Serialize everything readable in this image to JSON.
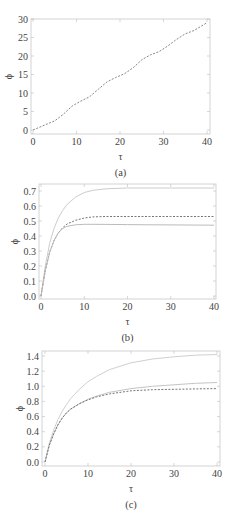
{
  "chart_data": [
    {
      "id": "a",
      "type": "line",
      "caption": "(a)",
      "xlabel": "τ",
      "ylabel": "ϕ",
      "xlim": [
        0,
        40
      ],
      "ylim": [
        0,
        30
      ],
      "xticks": [
        0,
        10,
        20,
        30,
        40
      ],
      "yticks": [
        0,
        5,
        10,
        15,
        20,
        25,
        30
      ],
      "grid": false,
      "series": [
        {
          "name": "dashed",
          "style": "dashed",
          "color": "#777777",
          "x": [
            0,
            3,
            5,
            7,
            9,
            11,
            13,
            15,
            17,
            19,
            21,
            23,
            25,
            27,
            29,
            31,
            33,
            35,
            37,
            40
          ],
          "y": [
            0,
            1.5,
            2.5,
            4.3,
            6.5,
            7.8,
            9.0,
            11.0,
            13.0,
            14.2,
            15.2,
            16.8,
            19.0,
            20.3,
            21.2,
            22.7,
            24.5,
            26.0,
            26.9,
            29.0
          ]
        }
      ]
    },
    {
      "id": "b",
      "type": "line",
      "caption": "(b)",
      "xlabel": "τ",
      "ylabel": "ϕ",
      "xlim": [
        0,
        40
      ],
      "ylim": [
        0,
        0.7
      ],
      "xticks": [
        0,
        10,
        20,
        30,
        40
      ],
      "yticks": [
        0.0,
        0.1,
        0.2,
        0.3,
        0.4,
        0.5,
        0.6,
        0.7
      ],
      "grid": false,
      "series": [
        {
          "name": "upper-solid",
          "style": "solid",
          "color": "#cccccc",
          "x": [
            0,
            1,
            2,
            3,
            4,
            5,
            6,
            8,
            10,
            12,
            15,
            20,
            25,
            30,
            40
          ],
          "y": [
            0,
            0.2,
            0.35,
            0.45,
            0.52,
            0.57,
            0.61,
            0.66,
            0.69,
            0.705,
            0.715,
            0.72,
            0.72,
            0.72,
            0.72
          ]
        },
        {
          "name": "dashed",
          "style": "dashed",
          "color": "#666666",
          "x": [
            0,
            1,
            2,
            3,
            4,
            5,
            6,
            8,
            10,
            12,
            15,
            20,
            25,
            30,
            40
          ],
          "y": [
            0,
            0.17,
            0.29,
            0.37,
            0.42,
            0.455,
            0.48,
            0.505,
            0.52,
            0.527,
            0.53,
            0.53,
            0.53,
            0.53,
            0.53
          ]
        },
        {
          "name": "lower-solid",
          "style": "solid",
          "color": "#bbbbbb",
          "x": [
            0,
            1,
            2,
            3,
            4,
            5,
            6,
            8,
            10,
            12,
            15,
            20,
            25,
            30,
            40
          ],
          "y": [
            0,
            0.17,
            0.29,
            0.37,
            0.42,
            0.45,
            0.465,
            0.475,
            0.478,
            0.478,
            0.477,
            0.476,
            0.475,
            0.474,
            0.472
          ]
        }
      ]
    },
    {
      "id": "c",
      "type": "line",
      "caption": "(c)",
      "xlabel": "τ",
      "ylabel": "ϕ",
      "xlim": [
        0,
        40
      ],
      "ylim": [
        0,
        1.4
      ],
      "xticks": [
        0,
        10,
        20,
        30,
        40
      ],
      "yticks": [
        0.0,
        0.2,
        0.4,
        0.6,
        0.8,
        1.0,
        1.2,
        1.4
      ],
      "grid": false,
      "series": [
        {
          "name": "upper-solid",
          "style": "solid",
          "color": "#d0d0d0",
          "x": [
            0,
            1,
            2,
            3,
            4,
            5,
            6,
            8,
            10,
            12,
            15,
            20,
            25,
            30,
            35,
            40
          ],
          "y": [
            0,
            0.25,
            0.42,
            0.56,
            0.67,
            0.76,
            0.84,
            0.96,
            1.06,
            1.13,
            1.22,
            1.31,
            1.36,
            1.39,
            1.41,
            1.42
          ]
        },
        {
          "name": "middle-solid",
          "style": "solid",
          "color": "#c4c4c4",
          "x": [
            0,
            1,
            2,
            3,
            4,
            5,
            6,
            8,
            10,
            12,
            15,
            20,
            25,
            30,
            35,
            40
          ],
          "y": [
            0,
            0.22,
            0.37,
            0.49,
            0.58,
            0.65,
            0.7,
            0.77,
            0.83,
            0.87,
            0.92,
            0.97,
            1.0,
            1.02,
            1.04,
            1.05
          ]
        },
        {
          "name": "dashed",
          "style": "dashed",
          "color": "#666666",
          "x": [
            0,
            1,
            2,
            3,
            4,
            5,
            6,
            8,
            10,
            12,
            15,
            20,
            25,
            30,
            35,
            40
          ],
          "y": [
            0,
            0.22,
            0.37,
            0.49,
            0.58,
            0.65,
            0.7,
            0.77,
            0.82,
            0.86,
            0.9,
            0.94,
            0.955,
            0.96,
            0.965,
            0.97
          ]
        }
      ]
    }
  ],
  "layout": {
    "panels": [
      {
        "top": 0,
        "frame": {
          "left": 31,
          "right": 210,
          "top": 19,
          "bottom": 134
        },
        "plot": {
          "x0": 33,
          "x1": 207,
          "y0": 130,
          "y1": 19
        },
        "ylabel_x": 9,
        "tick_w": 1
      },
      {
        "top": 0,
        "frame": {
          "left": 39,
          "right": 216,
          "top": 184,
          "bottom": 299
        },
        "plot": {
          "x0": 41,
          "x1": 214,
          "y0": 296,
          "y1": 191
        },
        "ylabel_x": 15,
        "tick_w": 1
      },
      {
        "top": 0,
        "frame": {
          "left": 42,
          "right": 220,
          "top": 351,
          "bottom": 466
        },
        "plot": {
          "x0": 45,
          "x1": 217,
          "y0": 462,
          "y1": 356
        },
        "ylabel_x": 20,
        "tick_w": 1
      }
    ]
  }
}
